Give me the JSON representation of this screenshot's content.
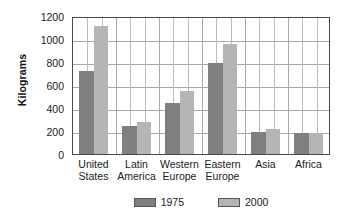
{
  "chart_data": {
    "type": "bar",
    "title": "",
    "subtitle": "",
    "xlabel": "",
    "ylabel": "Kilograms",
    "ylim": [
      0,
      1200
    ],
    "yticks": [
      0,
      200,
      400,
      600,
      800,
      1000,
      1200
    ],
    "ytick_labels": [
      "0",
      "200",
      "400",
      "600",
      "800",
      "1000",
      "1200"
    ],
    "grid": true,
    "grid_axis": "both",
    "legend_position": "bottom",
    "categories": [
      "United States",
      "Latin America",
      "Western Europe",
      "Eastern Europe",
      "Asia",
      "Africa"
    ],
    "category_lines": [
      [
        "United",
        "States"
      ],
      [
        "Latin",
        "America"
      ],
      [
        "Western",
        "Europe"
      ],
      [
        "Eastern",
        "Europe"
      ],
      [
        "Asia",
        ""
      ],
      [
        "Africa",
        ""
      ]
    ],
    "series": [
      {
        "name": "1975",
        "color": "#7f7f7f",
        "values": [
          720,
          240,
          445,
          790,
          195,
          185
        ]
      },
      {
        "name": "2000",
        "color": "#b5b5b5",
        "values": [
          1110,
          280,
          545,
          955,
          215,
          185
        ]
      }
    ]
  },
  "axis": {
    "y_title": "Kilograms"
  },
  "legend": {
    "items": [
      {
        "label": "1975",
        "color": "#7f7f7f"
      },
      {
        "label": "2000",
        "color": "#b5b5b5"
      }
    ]
  },
  "colors": {
    "series_1975": "#7f7f7f",
    "series_2000": "#b5b5b5",
    "plot_border": "#4a4a4a",
    "gridline_horizontal": "#a9a9a9",
    "gridline_vertical": "#bdbdbd",
    "background": "#ffffff",
    "text": "#1a1a1a"
  }
}
